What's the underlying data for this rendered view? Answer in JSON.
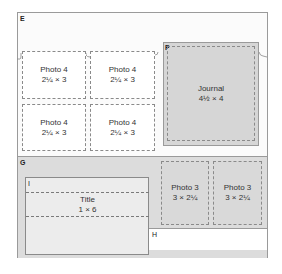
{
  "diagram": {
    "sections": {
      "E": "E",
      "F": "F",
      "G": "G",
      "H": "H",
      "I": "I"
    },
    "photo4_boxes": [
      {
        "title": "Photo 4",
        "size": "2¼ × 3"
      },
      {
        "title": "Photo 4",
        "size": "2¼ × 3"
      },
      {
        "title": "Photo 4",
        "size": "2¼ × 3"
      },
      {
        "title": "Photo 4",
        "size": "2¼ × 3"
      }
    ],
    "journal": {
      "title": "Journal",
      "size": "4½ × 4"
    },
    "title_box": {
      "title": "Title",
      "size": "1 × 6"
    },
    "photo3_boxes": [
      {
        "title": "Photo 3",
        "size": "3 × 2¼"
      },
      {
        "title": "Photo 3",
        "size": "3 × 2¼"
      }
    ],
    "colors": {
      "border": "#9a9a9a",
      "dashed": "#8a8a8a",
      "gray_fill": "#d6d6d6",
      "light_fill": "#ececec"
    }
  }
}
